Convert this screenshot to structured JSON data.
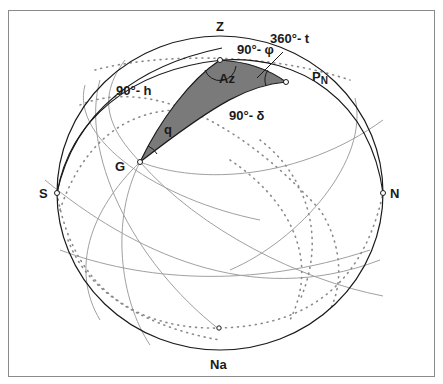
{
  "diagram": {
    "type": "celestial-sphere-astronomical-triangle",
    "colors": {
      "triangle_fill": "#7a7a7a",
      "outline": "#1a1a1a",
      "grey_arcs": "#9a9a9a",
      "dotted": "#8a8a8a",
      "frame": "#8a8a8a"
    },
    "points": {
      "zenith": "Z",
      "nadir": "Na",
      "south": "S",
      "north": "N",
      "pole_main": "P",
      "pole_sub": "N",
      "star": "G"
    },
    "arcs": {
      "colatitude": "90°- φ",
      "zenith_distance": "90°- h",
      "polar_distance": "90°- δ"
    },
    "angles": {
      "azimuth": "Az",
      "hour_angle": "360°- t",
      "parallactic": "q"
    }
  }
}
